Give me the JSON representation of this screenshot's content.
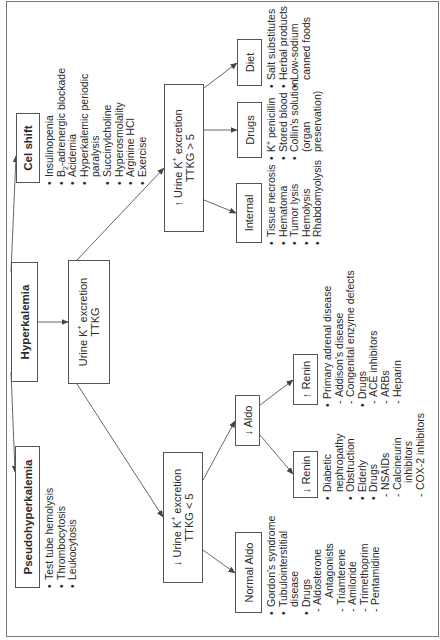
{
  "diagram": {
    "title": "Hyperkalemia",
    "rotation_deg": -90,
    "colors": {
      "line": "#555555",
      "text": "#2a2a2a",
      "background": "#ffffff"
    },
    "nodes": {
      "hyperkalemia": {
        "label": "Hyperkalemia"
      },
      "cell_shift": {
        "label": "Cel shift",
        "items": [
          {
            "text": "Insulinopenia",
            "type": "bullet"
          },
          {
            "text": "B2-adrenergic blockade",
            "type": "bullet"
          },
          {
            "text": "Acidemia",
            "type": "bullet"
          },
          {
            "text": "Hyperkalemic periodic",
            "type": "bullet"
          },
          {
            "text": "paralysis",
            "type": "cont"
          },
          {
            "text": "Succinylcholine",
            "type": "bullet"
          },
          {
            "text": "Hyperosmolality",
            "type": "bullet"
          },
          {
            "text": "Arginine HCl",
            "type": "bullet"
          },
          {
            "text": "Exercise",
            "type": "bullet"
          }
        ]
      },
      "pseudohyperkalemia": {
        "label": "Pseudohyperkalemia",
        "items": [
          {
            "text": "Test tube hemolysis",
            "type": "bullet"
          },
          {
            "text": "Thrombocytosis",
            "type": "bullet"
          },
          {
            "text": "Leukocytosis",
            "type": "bullet"
          }
        ]
      },
      "urine_excretion": {
        "line1": "Urine K",
        "sup": "+",
        "line1b": " excretion",
        "line2": "TTKG"
      },
      "urine_increased": {
        "arrow": "↑",
        "line1": " Urine K",
        "sup": "+",
        "line1b": " excretion",
        "line2": "TTKG > 5"
      },
      "urine_decreased": {
        "arrow": "↓",
        "line1": " Urine K",
        "sup": "+",
        "line1b": " excretion",
        "line2": "TTKG < 5"
      },
      "internal": {
        "label": "Internal",
        "items": [
          {
            "text": "Tissue necrosis",
            "type": "bullet"
          },
          {
            "text": "Hematoma",
            "type": "bullet"
          },
          {
            "text": "Tumor lysis",
            "type": "bullet"
          },
          {
            "text": "Hemolysis",
            "type": "bullet"
          },
          {
            "text": "Rhabdomyolysis",
            "type": "bullet"
          }
        ]
      },
      "drugs_high": {
        "label": "Drugs",
        "items": [
          {
            "text": "K+ penicillin",
            "type": "bullet"
          },
          {
            "text": "Stored blood",
            "type": "bullet"
          },
          {
            "text": "Collin's solution",
            "type": "bullet"
          },
          {
            "text": "(organ",
            "type": "cont"
          },
          {
            "text": "preservation)",
            "type": "cont"
          }
        ]
      },
      "diet": {
        "label": "Diet",
        "items": [
          {
            "text": "Salt substitutes",
            "type": "bullet"
          },
          {
            "text": "Herbal products",
            "type": "bullet"
          },
          {
            "text": "Low-sodium",
            "type": "bullet"
          },
          {
            "text": "canned foods",
            "type": "cont"
          }
        ]
      },
      "normal_aldo": {
        "label": "Normal Aldo",
        "items": [
          {
            "text": "Gordon's syndrome",
            "type": "bullet"
          },
          {
            "text": "Tubulointerstitial",
            "type": "bullet"
          },
          {
            "text": "disease",
            "type": "cont"
          },
          {
            "text": "Drugs",
            "type": "bullet"
          },
          {
            "text": "Aldosterone",
            "type": "sub"
          },
          {
            "text": "Antagonists",
            "type": "subcont"
          },
          {
            "text": "Triamterene",
            "type": "sub"
          },
          {
            "text": "Amiloride",
            "type": "sub"
          },
          {
            "text": "Trimethoprim",
            "type": "sub"
          },
          {
            "text": "Pentamidine",
            "type": "sub"
          }
        ]
      },
      "low_aldo": {
        "arrow": "↓",
        "label": " Aldo"
      },
      "low_renin": {
        "arrow": "↓",
        "label": " Renin",
        "items": [
          {
            "text": "Diabetic",
            "type": "bullet"
          },
          {
            "text": "nephropathy",
            "type": "cont"
          },
          {
            "text": "Obstruction",
            "type": "bullet"
          },
          {
            "text": "Elderly",
            "type": "bullet"
          },
          {
            "text": "Drugs",
            "type": "bullet"
          },
          {
            "text": "NSAIDs",
            "type": "sub"
          },
          {
            "text": "Calcineurin",
            "type": "sub"
          },
          {
            "text": "inhibitors",
            "type": "subcont"
          },
          {
            "text": "COX-2 inhibitors",
            "type": "sub"
          }
        ]
      },
      "high_renin": {
        "arrow": "↑",
        "label": " Renin",
        "items": [
          {
            "text": "Primary adrenal disease",
            "type": "bullet"
          },
          {
            "text": "Addison's disease",
            "type": "sub"
          },
          {
            "text": "Congenital enzyme defects",
            "type": "sub"
          },
          {
            "text": "Drugs",
            "type": "bullet"
          },
          {
            "text": "ACE inhibitors",
            "type": "sub"
          },
          {
            "text": "ARBs",
            "type": "sub"
          },
          {
            "text": "Heparin",
            "type": "sub"
          }
        ]
      }
    }
  }
}
